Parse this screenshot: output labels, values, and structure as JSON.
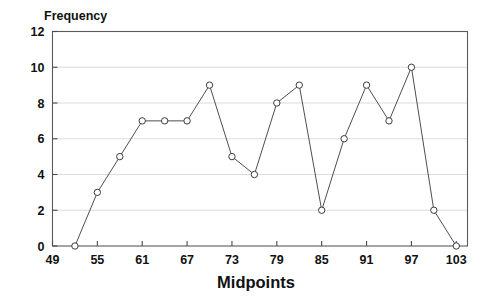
{
  "chart_data": {
    "type": "line",
    "title": "",
    "xlabel": "Midpoints",
    "ylabel": "Frequency",
    "x": [
      52,
      55,
      58,
      61,
      64,
      67,
      70,
      73,
      76,
      79,
      82,
      85,
      88,
      91,
      94,
      97,
      100,
      103
    ],
    "values": [
      0,
      3,
      5,
      7,
      7,
      7,
      9,
      5,
      4,
      8,
      9,
      2,
      6,
      9,
      7,
      10,
      2,
      0
    ],
    "series": [
      {
        "name": "Frequency",
        "values": [
          0,
          3,
          5,
          7,
          7,
          7,
          9,
          5,
          4,
          8,
          9,
          2,
          6,
          9,
          7,
          10,
          2,
          0
        ]
      }
    ],
    "xlim": [
      49,
      104.5
    ],
    "ylim": [
      0,
      12
    ],
    "x_tick_labels": [
      "49",
      "55",
      "61",
      "67",
      "73",
      "79",
      "85",
      "91",
      "97",
      "103"
    ],
    "x_ticks": [
      49,
      55,
      61,
      67,
      73,
      79,
      85,
      91,
      97,
      103
    ],
    "y_tick_labels": [
      "0",
      "2",
      "4",
      "6",
      "8",
      "10",
      "12"
    ],
    "y_ticks": [
      0,
      2,
      4,
      6,
      8,
      10,
      12
    ],
    "grid": true,
    "grid_axis": "y",
    "legend": false,
    "legend_position": "none",
    "marker": "circle-open",
    "colors": {
      "line": "#4e4e52",
      "marker_fill": "#ffffff",
      "marker_stroke": "#3c3c40",
      "grid": "#d8d8dc",
      "frame": "#5a5a5e",
      "text": "#111111",
      "background": "#ffffff"
    }
  },
  "labels": {
    "y_axis_title": "Frequency",
    "x_axis_title": "Midpoints"
  }
}
